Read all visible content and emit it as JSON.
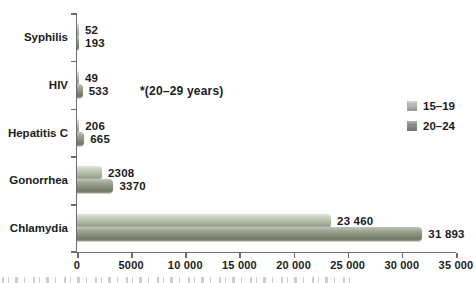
{
  "chart_data": {
    "type": "bar",
    "orientation": "horizontal",
    "title": "",
    "categories": [
      "Syphilis",
      "HIV",
      "Hepatitis C",
      "Gonorrhea",
      "Chlamydia"
    ],
    "series": [
      {
        "name": "15–19",
        "color": "#b6bcae",
        "values": [
          52,
          49,
          206,
          2308,
          23460
        ],
        "value_labels": [
          "52",
          "49",
          "206",
          "2308",
          "23 460"
        ]
      },
      {
        "name": "20–24",
        "color": "#8a9183",
        "values": [
          193,
          533,
          665,
          3370,
          31893
        ],
        "value_labels": [
          "193",
          "533",
          "665",
          "3370",
          "31 893"
        ]
      }
    ],
    "x_axis": {
      "min": 0,
      "max": 35000,
      "tick_step": 5000,
      "tick_labels": [
        "0",
        "5000",
        "10 000",
        "15 000",
        "20 000",
        "25 000",
        "30 000",
        "35 000"
      ]
    },
    "annotation": "*(20–29 years)",
    "legend": {
      "position": "right",
      "items": [
        {
          "label": "15–19",
          "color": "#b6bcae"
        },
        {
          "label": "20–24",
          "color": "#8a9183"
        }
      ]
    },
    "grid": false,
    "axis_color": "#6e6e6e",
    "text_color": "#1c1c1c"
  }
}
